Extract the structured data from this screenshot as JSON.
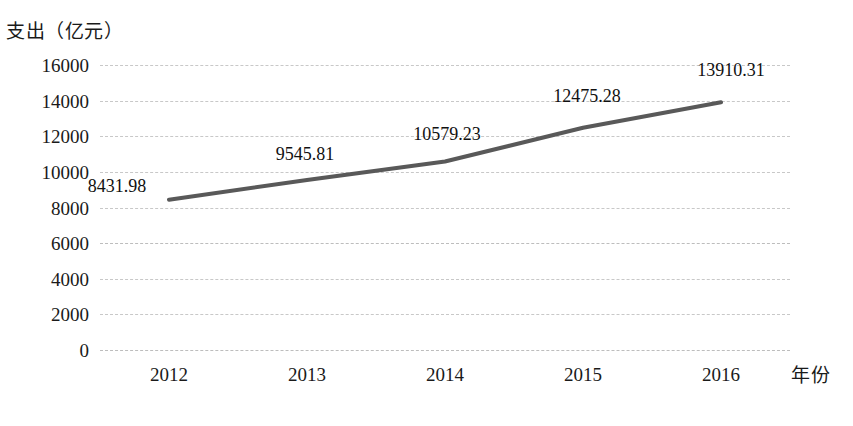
{
  "chart_data": {
    "type": "line",
    "title": "",
    "xlabel": "年份",
    "ylabel": "支出（亿元）",
    "categories": [
      "2012",
      "2013",
      "2014",
      "2015",
      "2016"
    ],
    "values": [
      8431.98,
      9545.81,
      10579.23,
      12475.28,
      13910.31
    ],
    "data_labels": [
      "8431.98",
      "9545.81",
      "10579.23",
      "12475.28",
      "13910.31"
    ],
    "ylim": [
      0,
      16000
    ],
    "ytick_labels": [
      "0",
      "2000",
      "4000",
      "6000",
      "8000",
      "10000",
      "12000",
      "14000",
      "16000"
    ],
    "ytick_values": [
      0,
      2000,
      4000,
      6000,
      8000,
      10000,
      12000,
      14000,
      16000
    ],
    "grid": true,
    "grid_style": "dashed",
    "legend": "none",
    "series_color": "#595959",
    "grid_color": "#c8c8c8",
    "markers": false,
    "line_width": 4
  },
  "axes": {
    "y_title": "支出（亿元）",
    "x_title": "年份"
  },
  "caption": {
    "text": ""
  }
}
